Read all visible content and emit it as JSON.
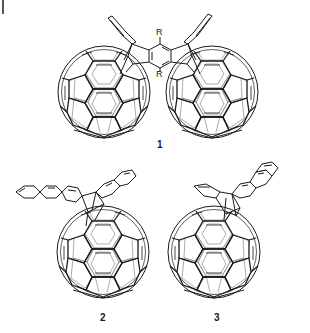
{
  "figure": {
    "compounds": [
      {
        "id": "1",
        "label": "1",
        "description": "bis-fullerene adduct bridged by R-substituted pentacene-type bis(triptycene) linker",
        "substituents": [
          "R",
          "R"
        ]
      },
      {
        "id": "2",
        "label": "2",
        "description": "C60 mono-adduct with anthracene/naphthalene bicyclic bridge"
      },
      {
        "id": "3",
        "label": "3",
        "description": "C60 mono-adduct with naphthalene bicyclic bridge (isomer)"
      }
    ],
    "r_top": "R",
    "r_bottom": "R",
    "colors": {
      "bond_front": "#1a1a1a",
      "bond_back": "#8a8a8a",
      "background": "#ffffff"
    }
  }
}
